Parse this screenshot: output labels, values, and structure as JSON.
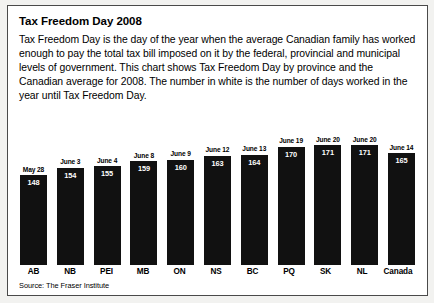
{
  "panel": {
    "title": "Tax Freedom Day 2008",
    "description": "Tax Freedom Day is the day of the year when the average Canadian family has worked enough to pay the total tax bill imposed on it by the federal, provincial and municipal levels of government. This chart shows Tax Freedom Day by province and the Canadian average for 2008. The number in white is the number of days worked in the year until Tax Freedom Day.",
    "source": "Source: The Fraser Institute"
  },
  "chart_data": {
    "type": "bar",
    "title": "Tax Freedom Day 2008",
    "xlabel": "",
    "ylabel": "Days worked in the year until Tax Freedom Day",
    "ylim": [
      0,
      180
    ],
    "grid": false,
    "legend": "none",
    "bar_color": "#111111",
    "value_label_color": "#ffffff",
    "categories": [
      "AB",
      "NB",
      "PEI",
      "MB",
      "ON",
      "NS",
      "BC",
      "PQ",
      "SK",
      "NL",
      "Canada"
    ],
    "values": [
      148,
      154,
      155,
      159,
      160,
      163,
      164,
      170,
      171,
      171,
      165
    ],
    "top_labels": [
      "May 28",
      "June 3",
      "June 4",
      "June 8",
      "June 9",
      "June 12",
      "June 13",
      "June 19",
      "June 20",
      "June 20",
      "June 14"
    ],
    "bars": [
      {
        "category": "AB",
        "date": "May 28",
        "value": 148
      },
      {
        "category": "NB",
        "date": "June 3",
        "value": 154
      },
      {
        "category": "PEI",
        "date": "June 4",
        "value": 155
      },
      {
        "category": "MB",
        "date": "June 8",
        "value": 159
      },
      {
        "category": "ON",
        "date": "June 9",
        "value": 160
      },
      {
        "category": "NS",
        "date": "June 12",
        "value": 163
      },
      {
        "category": "BC",
        "date": "June 13",
        "value": 164
      },
      {
        "category": "PQ",
        "date": "June 19",
        "value": 170
      },
      {
        "category": "SK",
        "date": "June 20",
        "value": 171
      },
      {
        "category": "NL",
        "date": "June 20",
        "value": 171
      },
      {
        "category": "Canada",
        "date": "June 14",
        "value": 165
      }
    ]
  }
}
